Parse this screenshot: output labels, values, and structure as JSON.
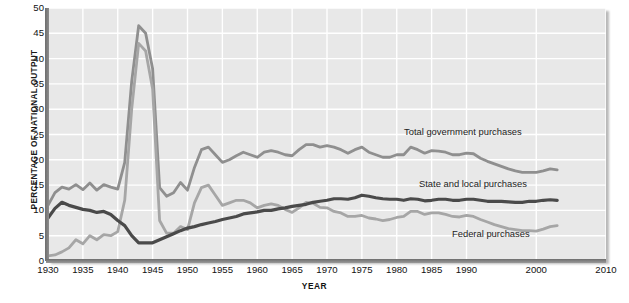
{
  "chart_data": {
    "type": "line",
    "title": "",
    "xlabel": "YEAR",
    "ylabel": "PERCENTAGE OF NATIONAL OUTPUT",
    "xlim": [
      1930,
      2010
    ],
    "ylim": [
      0,
      50
    ],
    "grid": true,
    "legend_position": "inline-annotations",
    "y_ticks": [
      0,
      5,
      10,
      15,
      20,
      25,
      30,
      35,
      40,
      45,
      50
    ],
    "x_ticks": [
      1930,
      1935,
      1940,
      1945,
      1950,
      1955,
      1960,
      1965,
      1970,
      1975,
      1980,
      1985,
      1990,
      2000,
      2010
    ],
    "x_tick_labels": [
      "1930",
      "1935",
      "1940",
      "1945",
      "1950",
      "1955",
      "1960",
      "1965",
      "1970",
      "1975",
      "1980",
      "1985",
      "1990",
      "2000",
      "2010"
    ],
    "colors": {
      "total": "#8f8f8f",
      "state_local": "#4a4a4a",
      "federal": "#a6a6a6",
      "plot_background": "#e8e8e8",
      "gridline": "#ffffff",
      "axis": "#6d6d6d",
      "text": "#1a1a1a"
    },
    "annotations": [
      {
        "text": "Total government purchases",
        "series": "total"
      },
      {
        "text": "State and local purchases",
        "series": "state_local"
      },
      {
        "text": "Federal purchases",
        "series": "federal"
      }
    ],
    "x": [
      1930,
      1931,
      1932,
      1933,
      1934,
      1935,
      1936,
      1937,
      1938,
      1939,
      1940,
      1941,
      1942,
      1943,
      1944,
      1945,
      1946,
      1947,
      1948,
      1949,
      1950,
      1951,
      1952,
      1953,
      1954,
      1955,
      1956,
      1957,
      1958,
      1959,
      1960,
      1961,
      1962,
      1963,
      1964,
      1965,
      1966,
      1967,
      1968,
      1969,
      1970,
      1971,
      1972,
      1973,
      1974,
      1975,
      1976,
      1977,
      1978,
      1979,
      1980,
      1981,
      1982,
      1983,
      1984,
      1985,
      1986,
      1987,
      1988,
      1989,
      1990,
      1991,
      1992,
      1993,
      1994,
      1995,
      1996,
      1997,
      1998,
      1999,
      2000,
      2001,
      2002,
      2003
    ],
    "series": [
      {
        "name": "Total government purchases",
        "color": "#8f8f8f",
        "values": [
          11.0,
          13.5,
          14.6,
          14.2,
          15.1,
          14.1,
          15.4,
          14.0,
          15.1,
          14.6,
          14.2,
          19.5,
          35.5,
          46.5,
          45.0,
          38.0,
          14.5,
          12.8,
          13.5,
          15.5,
          14.0,
          18.5,
          22.0,
          22.5,
          21.0,
          19.5,
          20.0,
          20.8,
          21.5,
          21.0,
          20.5,
          21.5,
          21.8,
          21.5,
          21.0,
          20.8,
          22.0,
          23.0,
          23.0,
          22.5,
          22.8,
          22.5,
          22.0,
          21.3,
          22.0,
          22.5,
          21.5,
          21.0,
          20.5,
          20.5,
          21.0,
          21.0,
          22.5,
          22.0,
          21.3,
          21.8,
          21.7,
          21.5,
          21.0,
          21.0,
          21.3,
          21.2,
          20.3,
          19.7,
          19.2,
          18.7,
          18.2,
          17.8,
          17.5,
          17.5,
          17.5,
          17.8,
          18.2,
          18.0
        ]
      },
      {
        "name": "State and local purchases",
        "color": "#4a4a4a",
        "values": [
          8.5,
          10.4,
          11.6,
          11.0,
          10.6,
          10.2,
          10.0,
          9.6,
          9.8,
          9.2,
          8.0,
          7.0,
          5.0,
          3.6,
          3.6,
          3.6,
          4.2,
          4.8,
          5.4,
          6.0,
          6.5,
          6.8,
          7.2,
          7.5,
          7.8,
          8.2,
          8.5,
          8.8,
          9.3,
          9.5,
          9.7,
          10.0,
          10.0,
          10.3,
          10.5,
          10.8,
          11.0,
          11.2,
          11.6,
          11.8,
          12.0,
          12.3,
          12.3,
          12.2,
          12.5,
          13.0,
          12.8,
          12.5,
          12.3,
          12.2,
          12.2,
          12.0,
          12.3,
          12.2,
          11.9,
          12.0,
          12.2,
          12.2,
          12.0,
          12.0,
          12.2,
          12.2,
          12.0,
          11.8,
          11.8,
          11.8,
          11.7,
          11.6,
          11.6,
          11.8,
          11.8,
          12.0,
          12.1,
          12.0
        ]
      },
      {
        "name": "Federal purchases",
        "color": "#a6a6a6",
        "values": [
          1.0,
          1.2,
          1.8,
          2.6,
          4.2,
          3.4,
          5.0,
          4.2,
          5.2,
          5.0,
          5.8,
          12.0,
          30.0,
          43.0,
          41.5,
          34.0,
          8.0,
          5.5,
          5.5,
          6.8,
          6.2,
          11.5,
          14.5,
          15.0,
          13.0,
          11.0,
          11.5,
          12.0,
          12.0,
          11.5,
          10.5,
          11.0,
          11.3,
          11.0,
          10.2,
          9.6,
          10.5,
          11.6,
          11.4,
          10.6,
          10.5,
          9.8,
          9.5,
          8.8,
          8.8,
          9.0,
          8.5,
          8.3,
          8.0,
          8.2,
          8.6,
          8.8,
          9.8,
          9.8,
          9.2,
          9.5,
          9.5,
          9.2,
          8.8,
          8.7,
          9.0,
          8.8,
          8.2,
          7.7,
          7.2,
          6.8,
          6.4,
          6.2,
          6.0,
          6.0,
          5.9,
          6.3,
          6.8,
          7.0
        ]
      }
    ]
  },
  "axis": {
    "y_title": "PERCENTAGE OF NATIONAL OUTPUT",
    "x_title": "YEAR"
  }
}
